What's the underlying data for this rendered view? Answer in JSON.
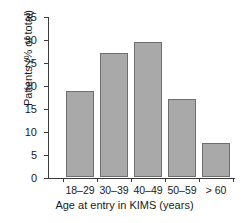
{
  "chart_data": {
    "type": "bar",
    "title": "",
    "categories": [
      "18–29",
      "30–39",
      "40–49",
      "50–59",
      "> 60"
    ],
    "values": [
      18.7,
      27.0,
      29.4,
      17.0,
      7.4
    ],
    "xlabel": "Age at entry in KIMS (years)",
    "ylabel": "Patients (% of total)",
    "ylim": [
      0,
      35
    ],
    "yticks": [
      0,
      5,
      10,
      15,
      20,
      25,
      30,
      35
    ],
    "ytick_labels": [
      "0",
      "5",
      "10",
      "15",
      "20",
      "25",
      "30",
      "35"
    ],
    "grid": false,
    "legend": false,
    "bar_color": "#a9a9a9",
    "bar_edge_color": "#6e6e6e",
    "axis_color": "#3b3b3b",
    "background": "#ffffff"
  }
}
